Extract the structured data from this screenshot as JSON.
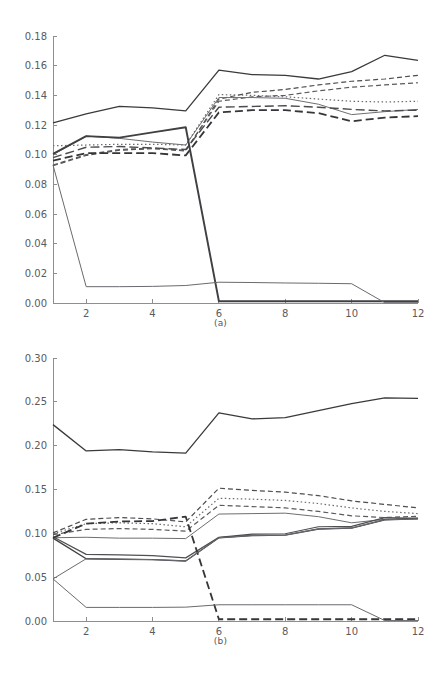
{
  "figure": {
    "background_color": "#ffffff",
    "axis_color": "#8d8d92",
    "text_color": "#5a5a5f"
  },
  "panels": [
    {
      "id": "a",
      "caption": "(a)"
    },
    {
      "id": "b",
      "caption": "(b)"
    }
  ],
  "chart_data": [
    {
      "type": "line",
      "title": "",
      "caption": "(a)",
      "xlabel": "",
      "ylabel": "",
      "grid": false,
      "legend": "none",
      "xlim": [
        1,
        12
      ],
      "ylim": [
        0.0,
        0.18
      ],
      "x": [
        1,
        2,
        3,
        4,
        5,
        6,
        7,
        8,
        9,
        10,
        11,
        12
      ],
      "xticks": [
        2,
        4,
        6,
        8,
        10,
        12
      ],
      "xtick_labels": [
        "2",
        "4",
        "6",
        "8",
        "10",
        "12"
      ],
      "yticks": [
        0.0,
        0.02,
        0.04,
        0.06,
        0.08,
        0.1,
        0.12,
        0.14,
        0.16,
        0.18
      ],
      "ytick_labels": [
        "0.00",
        "0.02",
        "0.04",
        "0.06",
        "0.08",
        "0.10",
        "0.12",
        "0.14",
        "0.16",
        "0.18"
      ],
      "series": [
        {
          "name": "series-1-solid-top",
          "style": "solid",
          "width": 1.3,
          "color": "#3a3a3d",
          "values": [
            0.1215,
            0.1275,
            0.1325,
            0.1315,
            0.1295,
            0.157,
            0.154,
            0.1535,
            0.151,
            0.156,
            0.167,
            0.1635
          ]
        },
        {
          "name": "series-2-dashed-upper",
          "style": "dashed",
          "width": 1.2,
          "color": "#4d4d52",
          "values": [
            0.0925,
            0.0995,
            0.103,
            0.104,
            0.1025,
            0.1375,
            0.142,
            0.144,
            0.147,
            0.1495,
            0.151,
            0.1535
          ]
        },
        {
          "name": "series-3-dashed-second",
          "style": "dashed",
          "width": 1.2,
          "color": "#5a5a5f",
          "values": [
            0.093,
            0.1,
            0.1035,
            0.1045,
            0.103,
            0.136,
            0.139,
            0.14,
            0.143,
            0.1455,
            0.147,
            0.1485
          ]
        },
        {
          "name": "series-4-dotted",
          "style": "dotted",
          "width": 1.2,
          "color": "#6a6a6f",
          "values": [
            0.106,
            0.1065,
            0.107,
            0.107,
            0.1065,
            0.1405,
            0.14,
            0.139,
            0.1375,
            0.136,
            0.1355,
            0.136
          ]
        },
        {
          "name": "series-5-thin-solid",
          "style": "solid",
          "width": 1.0,
          "color": "#6e6e73",
          "values": [
            0.1,
            0.1125,
            0.111,
            0.1085,
            0.1065,
            0.1385,
            0.1385,
            0.138,
            0.134,
            0.127,
            0.129,
            0.1305
          ]
        },
        {
          "name": "series-6-long-dash",
          "style": "long-dash",
          "width": 1.4,
          "color": "#4a4a4f",
          "values": [
            0.098,
            0.105,
            0.1055,
            0.1045,
            0.1035,
            0.132,
            0.1325,
            0.133,
            0.132,
            0.1305,
            0.1295,
            0.13
          ]
        },
        {
          "name": "series-7-thick-dash",
          "style": "thick-dash",
          "width": 1.8,
          "color": "#35353a",
          "values": [
            0.096,
            0.101,
            0.101,
            0.101,
            0.0995,
            0.1285,
            0.13,
            0.13,
            0.128,
            0.1225,
            0.125,
            0.126
          ]
        },
        {
          "name": "series-8-thick-drop-at-6",
          "style": "solid",
          "width": 1.9,
          "color": "#3f3f44",
          "values": [
            0.1005,
            0.1125,
            0.1115,
            0.115,
            0.1185,
            0.0012,
            0.0012,
            0.0012,
            0.0012,
            0.0012,
            0.0012,
            0.0012
          ]
        },
        {
          "name": "series-9-drop-at-2",
          "style": "solid",
          "width": 1.0,
          "color": "#6a6a6f",
          "values": [
            0.093,
            0.011,
            0.011,
            0.0112,
            0.0118,
            0.014,
            0.0138,
            0.0135,
            0.0133,
            0.013,
            0.0002,
            0.0002
          ]
        }
      ]
    },
    {
      "type": "line",
      "title": "",
      "caption": "(b)",
      "xlabel": "",
      "ylabel": "",
      "grid": false,
      "legend": "none",
      "xlim": [
        1,
        12
      ],
      "ylim": [
        0.0,
        0.3
      ],
      "x": [
        1,
        2,
        3,
        4,
        5,
        6,
        7,
        8,
        9,
        10,
        11,
        12
      ],
      "xticks": [
        2,
        4,
        6,
        8,
        10,
        12
      ],
      "xtick_labels": [
        "2",
        "4",
        "6",
        "8",
        "10",
        "12"
      ],
      "yticks": [
        0.0,
        0.05,
        0.1,
        0.15,
        0.2,
        0.25,
        0.3
      ],
      "ytick_labels": [
        "0.00",
        "0.05",
        "0.10",
        "0.15",
        "0.20",
        "0.25",
        "0.30"
      ],
      "series": [
        {
          "name": "series-1-solid-top",
          "style": "solid",
          "width": 1.3,
          "color": "#3a3a3d",
          "values": [
            0.224,
            0.194,
            0.1955,
            0.193,
            0.1915,
            0.2375,
            0.2305,
            0.232,
            0.24,
            0.248,
            0.2545,
            0.254
          ]
        },
        {
          "name": "series-2-dashed-upper",
          "style": "dashed",
          "width": 1.2,
          "color": "#4d4d52",
          "values": [
            0.1005,
            0.116,
            0.118,
            0.1165,
            0.113,
            0.1515,
            0.149,
            0.147,
            0.143,
            0.137,
            0.133,
            0.129
          ]
        },
        {
          "name": "series-3-dotted",
          "style": "dotted",
          "width": 1.2,
          "color": "#6a6a6f",
          "values": [
            0.0995,
            0.111,
            0.112,
            0.111,
            0.1075,
            0.14,
            0.139,
            0.1375,
            0.134,
            0.129,
            0.125,
            0.1225
          ]
        },
        {
          "name": "series-4-dashed-lower",
          "style": "dashed",
          "width": 1.2,
          "color": "#5a5a5f",
          "values": [
            0.0985,
            0.1045,
            0.1055,
            0.1045,
            0.1025,
            0.132,
            0.1305,
            0.129,
            0.125,
            0.12,
            0.118,
            0.1195
          ]
        },
        {
          "name": "series-5-thin-solid",
          "style": "solid",
          "width": 1.0,
          "color": "#6e6e73",
          "values": [
            0.095,
            0.0955,
            0.0945,
            0.0945,
            0.094,
            0.122,
            0.1225,
            0.123,
            0.119,
            0.112,
            0.116,
            0.1175
          ]
        },
        {
          "name": "series-6-rising-a",
          "style": "solid",
          "width": 1.2,
          "color": "#4f4f54",
          "values": [
            0.096,
            0.076,
            0.0755,
            0.0745,
            0.072,
            0.0955,
            0.099,
            0.0995,
            0.1075,
            0.108,
            0.118,
            0.117
          ]
        },
        {
          "name": "series-7-rising-b",
          "style": "solid",
          "width": 1.4,
          "color": "#3f3f44",
          "values": [
            0.0945,
            0.071,
            0.0705,
            0.07,
            0.0685,
            0.095,
            0.0975,
            0.098,
            0.105,
            0.106,
            0.1155,
            0.1165
          ]
        },
        {
          "name": "series-8-thick-dash-drop-at-6",
          "style": "thick-dash",
          "width": 1.8,
          "color": "#35353a",
          "values": [
            0.095,
            0.111,
            0.1135,
            0.114,
            0.119,
            0.002,
            0.002,
            0.002,
            0.002,
            0.002,
            0.002,
            0.002
          ]
        },
        {
          "name": "series-9-drop-at-2",
          "style": "solid",
          "width": 1.0,
          "color": "#6a6a6f",
          "values": [
            0.048,
            0.0155,
            0.0155,
            0.0155,
            0.0158,
            0.0185,
            0.0185,
            0.0185,
            0.0185,
            0.0185,
            0.0005,
            0.0005
          ]
        },
        {
          "name": "series-10-rise-from-low",
          "style": "solid",
          "width": 1.0,
          "color": "#6a6a6f",
          "values": [
            0.048,
            0.071,
            0.0705,
            0.07,
            0.0685,
            0.095,
            0.0975,
            0.098,
            0.105,
            0.106,
            0.1155,
            0.1165
          ]
        }
      ]
    }
  ]
}
